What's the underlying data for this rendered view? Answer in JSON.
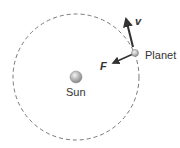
{
  "diagram": {
    "labels": {
      "sun": "Sun",
      "planet": "Planet",
      "velocity": "v",
      "force": "F"
    },
    "colors": {
      "orbit": "#777777",
      "arrow": "#333333",
      "text": "#333333"
    }
  }
}
